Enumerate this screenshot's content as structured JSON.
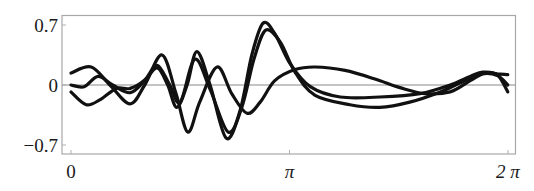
{
  "chart_data": {
    "type": "line",
    "title": "",
    "xlabel": "",
    "ylabel": "",
    "xlim": [
      0,
      6.2832
    ],
    "ylim": [
      -0.82,
      0.82
    ],
    "grid": false,
    "legend": null,
    "x_ticks": [
      {
        "value": 0,
        "label": "0"
      },
      {
        "value": 3.1416,
        "label": "π"
      },
      {
        "value": 6.2832,
        "label": "2 π"
      }
    ],
    "y_ticks": [
      {
        "value": 0.7,
        "label": "0.7"
      },
      {
        "value": 0,
        "label": "0"
      },
      {
        "value": -0.7,
        "label": "−0.7"
      }
    ],
    "zero_line": true,
    "series": [
      {
        "name": "curve-1",
        "color": "#111111",
        "x": [
          0,
          0.29,
          0.56,
          0.85,
          1.06,
          1.31,
          1.51,
          1.68,
          1.85,
          2.1,
          2.31,
          2.53,
          2.72,
          2.93,
          3.22,
          3.51,
          3.94,
          4.37,
          4.73,
          5.09,
          5.45,
          5.74,
          5.95,
          6.13,
          6.28
        ],
        "y": [
          0.14,
          0.21,
          0.0,
          -0.22,
          0.0,
          0.35,
          -0.1,
          -0.55,
          -0.2,
          0.21,
          -0.1,
          -0.33,
          -0.2,
          0.05,
          0.18,
          0.21,
          0.17,
          0.07,
          -0.03,
          -0.1,
          -0.08,
          0.05,
          0.14,
          0.13,
          0.12
        ]
      },
      {
        "name": "curve-2",
        "color": "#111111",
        "x": [
          0,
          0.19,
          0.39,
          0.6,
          0.85,
          1.06,
          1.24,
          1.39,
          1.52,
          1.67,
          1.81,
          2.0,
          2.23,
          2.43,
          2.6,
          2.76,
          2.93,
          3.15,
          3.44,
          3.87,
          4.44,
          5.02,
          5.45,
          5.74,
          5.92,
          6.13,
          6.28
        ],
        "y": [
          0.0,
          -0.02,
          0.1,
          0.0,
          -0.09,
          0.05,
          0.2,
          0.0,
          -0.26,
          0.0,
          0.39,
          0.0,
          -0.62,
          -0.3,
          0.35,
          0.72,
          0.6,
          0.25,
          -0.02,
          -0.14,
          -0.14,
          -0.1,
          0.0,
          0.1,
          0.15,
          0.12,
          -0.08
        ]
      },
      {
        "name": "curve-3",
        "color": "#111111",
        "x": [
          0,
          0.22,
          0.42,
          0.65,
          0.85,
          1.06,
          1.24,
          1.42,
          1.57,
          1.78,
          2.0,
          2.26,
          2.46,
          2.63,
          2.8,
          3.01,
          3.22,
          3.51,
          4.01,
          4.44,
          4.87,
          5.31,
          5.66,
          5.91,
          6.13,
          6.28
        ],
        "y": [
          -0.08,
          -0.23,
          -0.17,
          -0.04,
          -0.04,
          0.06,
          0.23,
          0.0,
          -0.2,
          0.3,
          -0.05,
          -0.55,
          -0.25,
          0.3,
          0.64,
          0.5,
          0.15,
          -0.12,
          -0.23,
          -0.26,
          -0.2,
          -0.08,
          0.05,
          0.13,
          0.11,
          0.0
        ]
      }
    ]
  }
}
